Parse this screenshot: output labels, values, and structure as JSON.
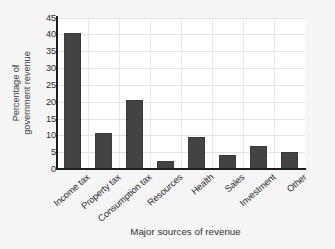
{
  "chart_data": {
    "type": "bar",
    "title": "",
    "xlabel": "Major sources of revenue",
    "ylabel_lines": [
      "Percentage of",
      "government revenue"
    ],
    "ylabel": "Percentage of government revenue",
    "categories": [
      "Income tax",
      "Property tax",
      "Consumption tax",
      "Resources",
      "Health",
      "Sales",
      "Investment",
      "Other"
    ],
    "values": [
      40.5,
      10.7,
      20.5,
      2.3,
      9.5,
      4.3,
      6.7,
      5.1
    ],
    "yticks": [
      0,
      5,
      10,
      15,
      20,
      25,
      30,
      35,
      40,
      45
    ],
    "ytick_labels": [
      "0",
      "5",
      "10",
      "15",
      "20",
      "25",
      "30",
      "35",
      "40",
      "45"
    ],
    "ylim": [
      0,
      45
    ],
    "grid": true,
    "legend": "none",
    "bar_color": "#434343",
    "plot_background": "#ffffff",
    "figure_background": "#f5f5f5",
    "grid_color": "#e3e3e3",
    "axis_color": "#1d1d1d"
  }
}
